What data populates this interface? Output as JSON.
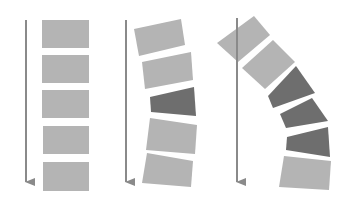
{
  "colors": {
    "background": "#ffffff",
    "block_light": "#b4b4b4",
    "block_dark": "#6e6e6e",
    "arrow": "#8a8a8a"
  },
  "panels": [
    {
      "name": "straight-column",
      "arrow": {
        "x": 26,
        "y1": 20,
        "y2": 190
      },
      "blocks": [
        {
          "shade": "light",
          "points": "42,20 89,20 89,48 42,48"
        },
        {
          "shade": "light",
          "points": "42,55 89,55 89,83 42,83"
        },
        {
          "shade": "light",
          "points": "42,90 89,90 89,118 42,118"
        },
        {
          "shade": "light",
          "points": "43,126 89,126 89,154 43,154"
        },
        {
          "shade": "light",
          "points": "43,162 89,162 89,191 43,191"
        }
      ]
    },
    {
      "name": "slight-curve-column",
      "arrow": {
        "x": 126,
        "y1": 20,
        "y2": 190
      },
      "blocks": [
        {
          "shade": "light",
          "points": "134,29 181,19 185,45 139,56"
        },
        {
          "shade": "light",
          "points": "142,62 191,52 193,80 145,89"
        },
        {
          "shade": "dark",
          "points": "150,97 194,87 196,116 151,112"
        },
        {
          "shade": "light",
          "points": "150,118 197,125 195,154 146,150"
        },
        {
          "shade": "light",
          "points": "147,153 193,161 191,187 142,183"
        }
      ]
    },
    {
      "name": "strong-curve-column",
      "arrow": {
        "x": 237,
        "y1": 18,
        "y2": 190
      },
      "blocks": [
        {
          "shade": "light",
          "points": "217,43 254,16 270,35 238,62"
        },
        {
          "shade": "light",
          "points": "242,68 273,40 295,62 265,89"
        },
        {
          "shade": "dark",
          "points": "268,96 296,66 315,93 273,108"
        },
        {
          "shade": "dark",
          "points": "280,114 312,98 328,121 286,128"
        },
        {
          "shade": "dark",
          "points": "287,137 328,127 330,157 286,150"
        },
        {
          "shade": "light",
          "points": "284,156 331,161 329,190 279,187"
        }
      ]
    }
  ]
}
